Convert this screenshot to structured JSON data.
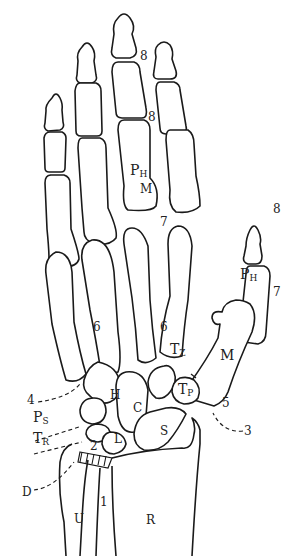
{
  "diagram": {
    "colors": {
      "line": "#1a1a1a",
      "background": "#ffffff"
    },
    "bone_labels": {
      "phalanx_middle": {
        "main": "P",
        "sub": "H"
      },
      "phalanx_thumb": {
        "main": "P",
        "sub": "H"
      },
      "metacarpal_middle": "M",
      "metacarpal_thumb": "M",
      "trapezoid": {
        "main": "T",
        "sub": "Z"
      },
      "trapezium": {
        "main": "T",
        "sub": "P"
      },
      "hamate": "H",
      "capitate": "C",
      "pisiform": {
        "main": "P",
        "sub": "S"
      },
      "triquetrum": {
        "main": "T",
        "sub": "R"
      },
      "lunate": "L",
      "scaphoid": "S",
      "ulna": "U",
      "radius": "R",
      "disc": "D"
    },
    "joint_numbers": {
      "dip_middle": "8",
      "pip_middle": "8",
      "mcp_middle": "7",
      "cmc_left": "6",
      "cmc_right": "6",
      "thumb_ip": "8",
      "thumb_mcp": "7",
      "thumb_cmc": "5",
      "midcarpal_ulnar": "4",
      "midcarpal_radial": "3",
      "radiocarpal": "2",
      "distal_radioulnar": "1"
    }
  }
}
